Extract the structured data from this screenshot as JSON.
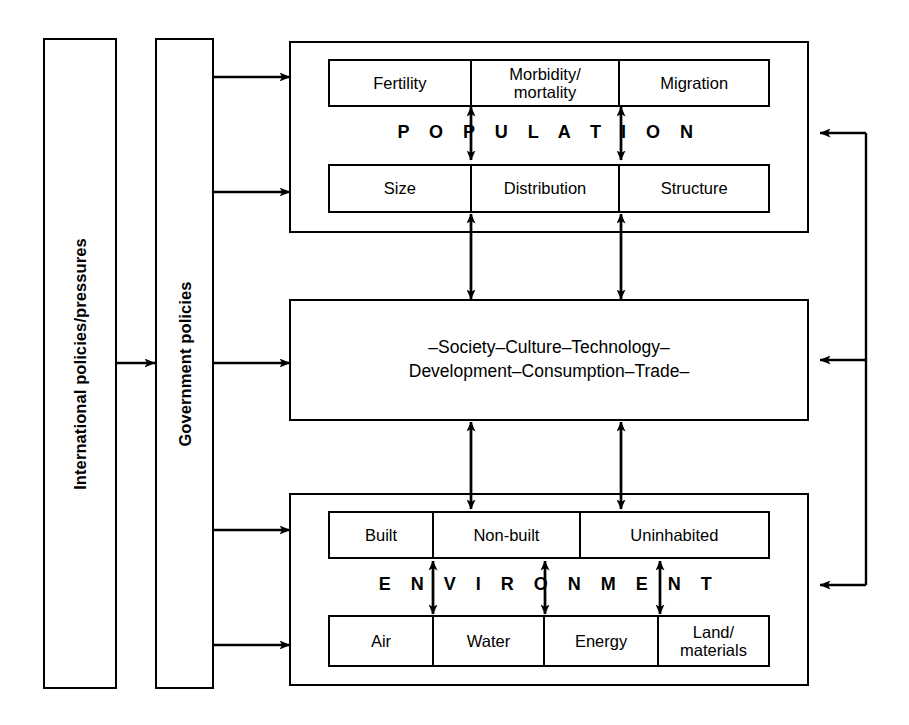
{
  "diagram": {
    "ink_color": "#000000",
    "background_color": "#ffffff"
  },
  "left_columns": [
    {
      "id": "international",
      "label": "International policies/pressures"
    },
    {
      "id": "government",
      "label": "Government policies"
    }
  ],
  "population_block": {
    "band_label": "POPULATION",
    "band_label_spaced": "P O P U L A T I O N",
    "top_row": [
      {
        "label": "Fertility"
      },
      {
        "label": "Morbidity/\nmortality"
      },
      {
        "label": "Migration"
      }
    ],
    "bottom_row": [
      {
        "label": "Size"
      },
      {
        "label": "Distribution"
      },
      {
        "label": "Structure"
      }
    ]
  },
  "society_block": {
    "line1": "–Society–Culture–Technology–",
    "line2": "Development–Consumption–Trade–"
  },
  "environment_block": {
    "band_label": "ENVIRONMENT",
    "band_label_spaced": "E N V I R O N M E N T",
    "top_row": [
      {
        "label": "Built"
      },
      {
        "label": "Non-built"
      },
      {
        "label": "Uninhabited"
      }
    ],
    "bottom_row": [
      {
        "label": "Air"
      },
      {
        "label": "Water"
      },
      {
        "label": "Energy"
      },
      {
        "label": "Land/\nmaterials"
      }
    ]
  },
  "connectors": {
    "international_to_government": 1,
    "government_outflows": 5,
    "feedback_returns": 3,
    "vertical_exchange_pairs": 4
  }
}
